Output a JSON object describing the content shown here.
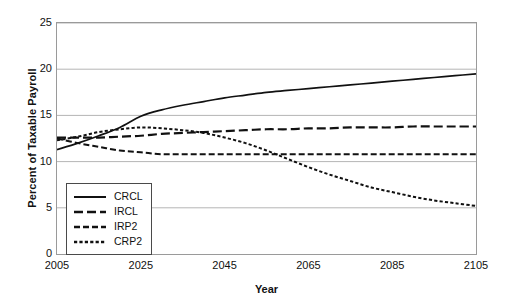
{
  "chart_data": {
    "type": "line",
    "title": "",
    "xlabel": "Year",
    "ylabel": "Percent of Taxable Payroll",
    "xlim": [
      2005,
      2105
    ],
    "ylim": [
      0,
      25
    ],
    "xticks": [
      2005,
      2025,
      2045,
      2065,
      2085,
      2105
    ],
    "yticks": [
      0,
      5,
      10,
      15,
      20,
      25
    ],
    "grid": "horizontal",
    "legend_position": "lower-left-inside",
    "x": [
      2005,
      2010,
      2015,
      2020,
      2025,
      2030,
      2035,
      2040,
      2045,
      2050,
      2055,
      2060,
      2065,
      2070,
      2075,
      2080,
      2085,
      2090,
      2095,
      2100,
      2105
    ],
    "series": [
      {
        "name": "CRCL",
        "style": "solid",
        "color": "#111111",
        "values": [
          11.3,
          12.0,
          12.8,
          13.7,
          14.9,
          15.6,
          16.1,
          16.5,
          16.9,
          17.2,
          17.5,
          17.7,
          17.9,
          18.1,
          18.3,
          18.5,
          18.7,
          18.9,
          19.1,
          19.3,
          19.5
        ]
      },
      {
        "name": "IRCL",
        "style": "long-dash",
        "color": "#111111",
        "values": [
          12.6,
          12.6,
          12.6,
          12.7,
          12.8,
          13.0,
          13.1,
          13.2,
          13.3,
          13.4,
          13.5,
          13.5,
          13.6,
          13.6,
          13.7,
          13.7,
          13.7,
          13.8,
          13.8,
          13.8,
          13.8
        ]
      },
      {
        "name": "IRP2",
        "style": "medium-dash",
        "color": "#111111",
        "values": [
          12.5,
          12.0,
          11.6,
          11.2,
          11.0,
          10.8,
          10.8,
          10.8,
          10.8,
          10.8,
          10.8,
          10.8,
          10.8,
          10.8,
          10.8,
          10.8,
          10.8,
          10.8,
          10.8,
          10.8,
          10.8
        ]
      },
      {
        "name": "CRP2",
        "style": "dotted-dash",
        "color": "#111111",
        "values": [
          12.3,
          12.7,
          13.2,
          13.5,
          13.7,
          13.6,
          13.4,
          13.1,
          12.6,
          12.0,
          11.2,
          10.3,
          9.4,
          8.6,
          7.9,
          7.2,
          6.7,
          6.2,
          5.8,
          5.5,
          5.2
        ]
      }
    ]
  },
  "axis": {
    "ylabel": "Percent of Taxable Payroll",
    "xlabel": "Year",
    "yticks": [
      "0",
      "5",
      "10",
      "15",
      "20",
      "25"
    ],
    "xticks": [
      "2005",
      "2025",
      "2045",
      "2065",
      "2085",
      "2105"
    ]
  },
  "legend": {
    "items": [
      {
        "label": "CRCL"
      },
      {
        "label": "IRCL"
      },
      {
        "label": "IRP2"
      },
      {
        "label": "CRP2"
      }
    ]
  }
}
